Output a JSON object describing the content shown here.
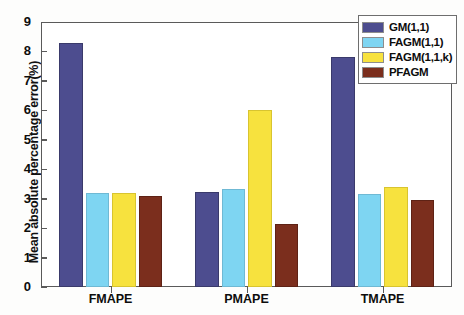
{
  "chart_data": {
    "type": "bar",
    "title": "",
    "xlabel": "",
    "ylabel": "Mean absolute percentage error(%)",
    "categories": [
      "FMAPE",
      "PMAPE",
      "TMAPE"
    ],
    "series": [
      {
        "name": "GM(1,1)",
        "color": "#4d4d8f",
        "values": [
          8.35,
          3.25,
          7.85
        ]
      },
      {
        "name": "FAGM(1,1)",
        "color": "#7ed5f2",
        "values": [
          3.2,
          3.35,
          3.15
        ]
      },
      {
        "name": "FAGM(1,1,k)",
        "color": "#f7e23e",
        "values": [
          3.2,
          6.05,
          3.4
        ]
      },
      {
        "name": "PFAGM",
        "color": "#7b2e1d",
        "values": [
          3.1,
          2.15,
          2.95
        ]
      }
    ],
    "ylim": [
      0,
      9
    ],
    "yticks": [
      0,
      1,
      2,
      3,
      4,
      5,
      6,
      7,
      8,
      9
    ],
    "ytick_labels": [
      "0",
      "1",
      "2",
      "3",
      "4",
      "5",
      "6",
      "7",
      "8",
      "9"
    ],
    "grid": false,
    "legend_position": "top-right",
    "legend_entries": [
      "GM(1,1)",
      "FAGM(1,1)",
      "FAGM(1,1,k)",
      "PFAGM"
    ]
  }
}
